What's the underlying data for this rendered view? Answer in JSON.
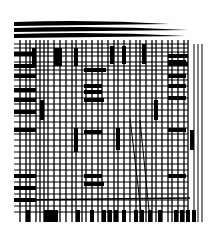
{
  "artwork": {
    "title": "",
    "background": "#ffffff",
    "ink": "#000000",
    "description": "abstract black line grid",
    "h_lines": [
      44,
      48,
      52,
      56,
      62,
      66,
      70,
      74,
      80,
      86,
      92,
      98,
      104,
      110,
      116,
      122,
      128,
      134,
      140,
      146,
      152,
      158,
      164,
      170,
      176,
      182,
      188,
      194,
      200,
      206,
      212
    ],
    "v_lines": [
      20,
      26,
      30,
      36,
      40,
      44,
      48,
      54,
      60,
      66,
      72,
      76,
      82,
      86,
      92,
      98,
      102,
      108,
      114,
      118,
      124,
      130,
      136,
      140,
      146,
      152,
      156,
      162,
      168,
      172,
      178,
      184,
      188
    ],
    "v_bold": [
      [
        34,
        48,
        66
      ],
      [
        56,
        48,
        66
      ],
      [
        60,
        48,
        66
      ],
      [
        76,
        48,
        66
      ],
      [
        112,
        46,
        64
      ],
      [
        124,
        46,
        64
      ],
      [
        144,
        44,
        64
      ],
      [
        42,
        100,
        120
      ],
      [
        156,
        100,
        120
      ],
      [
        76,
        128,
        152
      ],
      [
        118,
        128,
        150
      ],
      [
        192,
        130,
        150
      ]
    ],
    "h_bold": [
      [
        14,
        54,
        22
      ],
      [
        14,
        66,
        22
      ],
      [
        14,
        76,
        22
      ],
      [
        14,
        90,
        22
      ],
      [
        14,
        100,
        22
      ],
      [
        14,
        112,
        22
      ],
      [
        14,
        130,
        22
      ],
      [
        14,
        176,
        22
      ],
      [
        14,
        188,
        22
      ],
      [
        14,
        200,
        22
      ],
      [
        84,
        70,
        22
      ],
      [
        84,
        86,
        18
      ],
      [
        84,
        92,
        18
      ],
      [
        84,
        100,
        20
      ],
      [
        84,
        132,
        18
      ],
      [
        84,
        176,
        18
      ],
      [
        84,
        184,
        20
      ],
      [
        168,
        56,
        20
      ],
      [
        168,
        64,
        20
      ],
      [
        168,
        76,
        18
      ],
      [
        168,
        86,
        18
      ],
      [
        168,
        98,
        18
      ],
      [
        168,
        130,
        18
      ],
      [
        168,
        176,
        18
      ],
      [
        168,
        62,
        18
      ]
    ],
    "arcs": [
      [
        14,
        24,
        170
      ],
      [
        14,
        30,
        188
      ],
      [
        14,
        36,
        186
      ]
    ],
    "bottom_teeth": [
      28,
      46,
      50,
      54,
      56,
      78,
      92,
      104,
      110,
      116,
      124,
      136,
      142,
      150,
      160,
      176,
      182,
      188,
      194
    ]
  }
}
